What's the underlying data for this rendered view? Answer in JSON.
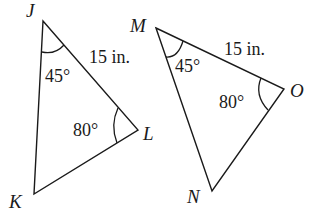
{
  "figure": {
    "triangle1": {
      "name": "JKL",
      "vertices": {
        "J": "J",
        "K": "K",
        "L": "L"
      },
      "angle_J": "45°",
      "angle_L": "80°",
      "side_JL": "15 in."
    },
    "triangle2": {
      "name": "MNO",
      "vertices": {
        "M": "M",
        "N": "N",
        "O": "O"
      },
      "angle_M": "45°",
      "angle_O": "80°",
      "side_MO": "15 in."
    }
  }
}
